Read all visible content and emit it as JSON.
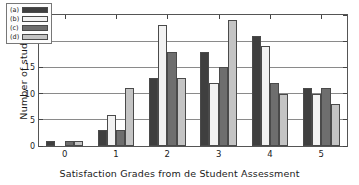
{
  "chart_data": {
    "type": "bar",
    "title": "",
    "xlabel": "Satisfaction Grades from de Student Assessment",
    "ylabel": "Number of students",
    "categories": [
      "0",
      "1",
      "2",
      "3",
      "4",
      "5"
    ],
    "ylim": [
      0,
      25
    ],
    "yticks": [
      0,
      5,
      10,
      15,
      20,
      25
    ],
    "ytick_labels": [
      "0",
      "5",
      "10",
      "15",
      "20",
      "25"
    ],
    "grid": true,
    "legend_position": "upper left",
    "series": [
      {
        "name": "(a)",
        "color": "#3f3f3f",
        "values": [
          1,
          3,
          13,
          18,
          21,
          11
        ]
      },
      {
        "name": "(b)",
        "color": "#f2f2f2",
        "values": [
          0,
          6,
          23,
          12,
          19,
          10
        ]
      },
      {
        "name": "(c)",
        "color": "#6e6e6e",
        "values": [
          1,
          3,
          18,
          15,
          12,
          11
        ]
      },
      {
        "name": "(d)",
        "color": "#c4c4c4",
        "values": [
          1,
          11,
          13,
          24,
          10,
          8
        ]
      }
    ]
  }
}
